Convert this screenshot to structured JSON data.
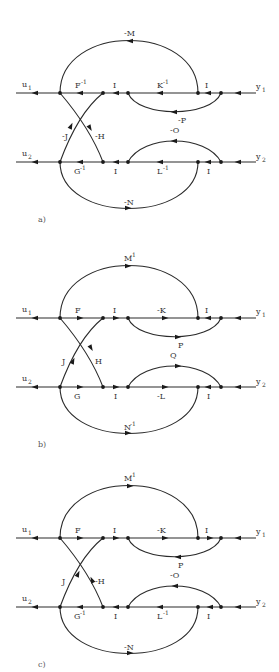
{
  "figure": {
    "background": "#ffffff",
    "line_color": "#2a2a2a",
    "panels": [
      {
        "id": "a",
        "caption": "a)",
        "y_offset": 0,
        "inputs": {
          "top": "u",
          "top_sub": "1",
          "bottom": "u",
          "bottom_sub": "2"
        },
        "outputs": {
          "top": "y",
          "top_sub": "1",
          "bottom": "y",
          "bottom_sub": "2"
        },
        "labels": {
          "top_arc": "-M",
          "top_arc_sup": "",
          "F": "F",
          "F_sup": "-1",
          "I_top": "I",
          "K": "K",
          "K_sup": "-1",
          "I_top_right": "I",
          "P": "-P",
          "J": "-J",
          "H": "-H",
          "G": "G",
          "G_sup": "-1",
          "I_bot": "I",
          "L": "L",
          "L_sup": "-1",
          "I_bot_right": "I",
          "O": "-O",
          "N": "-N",
          "N_sup": ""
        },
        "direction": "backward"
      },
      {
        "id": "b",
        "caption": "b)",
        "y_offset": 225,
        "inputs": {
          "top": "u",
          "top_sub": "1",
          "bottom": "u",
          "bottom_sub": "2"
        },
        "outputs": {
          "top": "y",
          "top_sub": "1",
          "bottom": "y",
          "bottom_sub": "2"
        },
        "labels": {
          "top_arc": "M",
          "top_arc_sup": "-1",
          "F": "F",
          "F_sup": "",
          "I_top": "I",
          "K": "-K",
          "K_sup": "",
          "I_top_right": "I",
          "P": "P",
          "J": "J",
          "H": "H",
          "G": "G",
          "G_sup": "",
          "I_bot": "I",
          "L": "-L",
          "L_sup": "",
          "I_bot_right": "I",
          "O": "Q",
          "N": "N",
          "N_sup": "-1"
        },
        "direction": "forward"
      },
      {
        "id": "c",
        "caption": "c)",
        "y_offset": 445,
        "inputs": {
          "top": "u",
          "top_sub": "1",
          "bottom": "u",
          "bottom_sub": "2"
        },
        "outputs": {
          "top": "y",
          "top_sub": "1",
          "bottom": "y",
          "bottom_sub": "2"
        },
        "labels": {
          "top_arc": "M",
          "top_arc_sup": "-1",
          "F": "F",
          "F_sup": "",
          "I_top": "I",
          "K": "-K",
          "K_sup": "",
          "I_top_right": "I",
          "P": "P",
          "J": "J",
          "H": "-H",
          "G": "G",
          "G_sup": "-1",
          "I_bot": "I",
          "L": "L",
          "L_sup": "-1",
          "I_bot_right": "I",
          "O": "-O",
          "N": "-N",
          "N_sup": ""
        },
        "direction": "mixed"
      }
    ]
  }
}
